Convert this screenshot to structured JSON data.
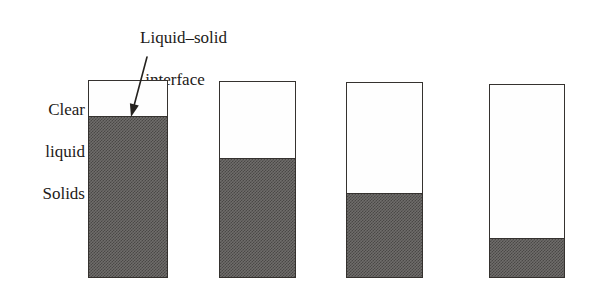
{
  "figure": {
    "type": "batch-sedimentation-diagram",
    "background_color": "#ffffff",
    "line_color": "#35322f",
    "solids_fill_color": "#6f6d6b",
    "clear_liquid_color": "#fefefe"
  },
  "labels": {
    "interface_line1": "Liquid–solid",
    "interface_line2": "interface",
    "clear_liquid_line1": "Clear",
    "clear_liquid_line2": "liquid",
    "solids": "Solids"
  },
  "annotations": {
    "arrow": {
      "name": "interface-pointer-arrow",
      "from_x": 147,
      "from_y": 57,
      "to_x": 131,
      "to_y": 117
    }
  },
  "chart_data": {
    "type": "diagram",
    "title": "Liquid–solid interface",
    "cylinders": [
      {
        "index": 1,
        "name": "cylinder-1",
        "x": 88,
        "y": 80,
        "width": 80,
        "height": 198,
        "interface_y": 117,
        "solids_height": 161,
        "solids_fraction": 0.81
      },
      {
        "index": 2,
        "name": "cylinder-2",
        "x": 219,
        "y": 81,
        "width": 77,
        "height": 197,
        "interface_y": 159,
        "solids_height": 119,
        "solids_fraction": 0.6
      },
      {
        "index": 3,
        "name": "cylinder-3",
        "x": 346,
        "y": 82,
        "width": 77,
        "height": 196,
        "interface_y": 194,
        "solids_height": 84,
        "solids_fraction": 0.43
      },
      {
        "index": 4,
        "name": "cylinder-4",
        "x": 489,
        "y": 84,
        "width": 76,
        "height": 194,
        "interface_y": 239,
        "solids_height": 39,
        "solids_fraction": 0.2
      }
    ]
  }
}
